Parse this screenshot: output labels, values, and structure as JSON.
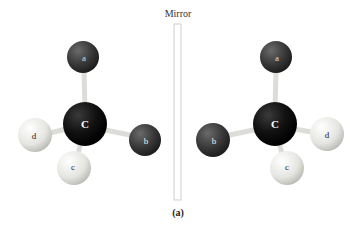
{
  "mirror_label": "Mirror",
  "caption": "(a)",
  "left_molecule": {
    "center": "C",
    "substituents": [
      "a",
      "b",
      "c",
      "d"
    ]
  },
  "right_molecule": {
    "center": "C",
    "substituents": [
      "a",
      "b",
      "c",
      "d"
    ]
  },
  "colors": {
    "dark_atom": "#3a3a3a",
    "carbon": "#111111",
    "light_atom": "#e8e8e4",
    "bond": "#e0e0dc",
    "mirror_border": "#cccccc"
  }
}
